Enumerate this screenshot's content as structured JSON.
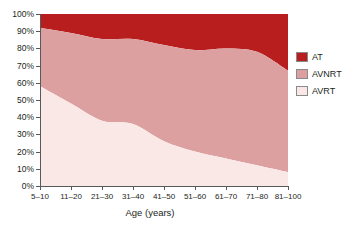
{
  "chart_data": {
    "type": "area",
    "stacked": true,
    "normalized_percent": true,
    "title": "",
    "xlabel": "Age (years)",
    "ylabel": "",
    "categories": [
      "5–10",
      "11–20",
      "21–30",
      "31–40",
      "41–50",
      "51–60",
      "61–70",
      "71–80",
      "81–100"
    ],
    "series": [
      {
        "name": "AVRT",
        "color": "#fae8e6",
        "values": [
          58,
          48,
          38,
          36,
          26,
          20,
          16,
          12,
          8
        ]
      },
      {
        "name": "AVNRT",
        "color": "#dca0a0",
        "values": [
          34,
          41,
          47.5,
          49.5,
          56,
          59,
          64,
          66,
          59
        ]
      },
      {
        "name": "AT",
        "color": "#b81e1e",
        "values": [
          8,
          11,
          14.5,
          14.5,
          18,
          21,
          20,
          22,
          33
        ]
      }
    ],
    "cumulative_boundaries": {
      "avrt_top": [
        58,
        48,
        38,
        36,
        26,
        20,
        16,
        12,
        8
      ],
      "avnrt_top": [
        92,
        89,
        85.5,
        85.5,
        82,
        79,
        80,
        78,
        67
      ],
      "at_top": [
        100,
        100,
        100,
        100,
        100,
        100,
        100,
        100,
        100
      ]
    },
    "ylim": [
      0,
      100
    ],
    "ytick_values": [
      0,
      10,
      20,
      30,
      40,
      50,
      60,
      70,
      80,
      90,
      100
    ],
    "ytick_labels": [
      "0%",
      "10%",
      "20%",
      "30%",
      "40%",
      "50%",
      "60%",
      "70%",
      "80%",
      "90%",
      "100%"
    ],
    "grid": false,
    "legend_position": "right",
    "legend": [
      {
        "label": "AT",
        "color": "#b81e1e"
      },
      {
        "label": "AVNRT",
        "color": "#dca0a0"
      },
      {
        "label": "AVRT",
        "color": "#fae8e6"
      }
    ]
  },
  "figure": {
    "background_color": "#ffffff",
    "axis_color": "#58595b",
    "text_color": "#231f20"
  }
}
